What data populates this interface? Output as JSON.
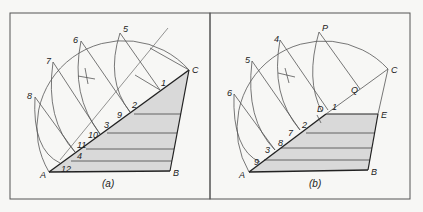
{
  "figure": {
    "panel_a": {
      "caption": "(a)",
      "vertices": {
        "A": "A",
        "B": "B",
        "C": "C"
      },
      "arc_points": [
        "5",
        "6",
        "7",
        "8"
      ],
      "line_labels": [
        "1",
        "2",
        "3",
        "4",
        "9",
        "10",
        "11",
        "12"
      ]
    },
    "panel_b": {
      "caption": "(b)",
      "vertices": {
        "A": "A",
        "B": "B",
        "C": "C",
        "D": "D",
        "E": "E",
        "P": "P",
        "Q": "Q"
      },
      "arc_points": [
        "4",
        "5",
        "6"
      ],
      "line_labels": [
        "1",
        "2",
        "3",
        "7",
        "8",
        "9"
      ]
    },
    "colors": {
      "shade": "#d9d9d9",
      "line": "#333333",
      "frame": "#555555",
      "background": "#f7f7f5"
    }
  }
}
